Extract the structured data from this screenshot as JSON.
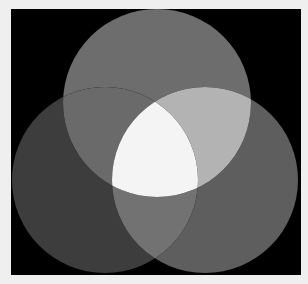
{
  "diagram": {
    "type": "venn-3-circles",
    "page_background": "#efefef",
    "frame": {
      "x": 11,
      "y": 9,
      "width": 290,
      "height": 266,
      "fill": "#000000"
    },
    "circles": [
      {
        "id": "top",
        "cx": 157,
        "cy": 103,
        "r": 94
      },
      {
        "id": "left",
        "cx": 105,
        "cy": 180,
        "r": 93
      },
      {
        "id": "right",
        "cx": 205,
        "cy": 180,
        "r": 93
      }
    ],
    "regions": {
      "top_only": "#6d6d6d",
      "left_only": "#3d3d3d",
      "right_only": "#5e5e5e",
      "top_left": "#6a6a6a",
      "top_right": "#b3b3b3",
      "left_right": "#727272",
      "all_three": "#f4f4f4"
    }
  }
}
